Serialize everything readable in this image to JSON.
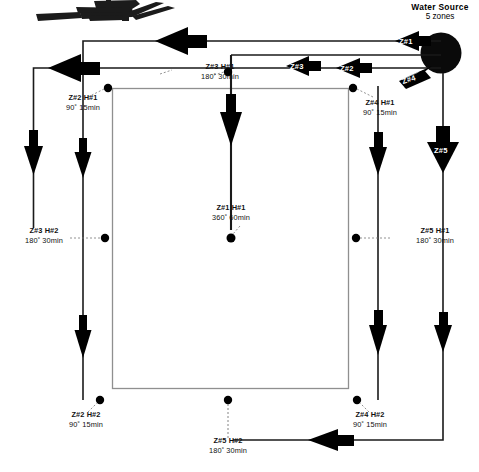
{
  "header": {
    "title_line1": "Water Source",
    "title_line2": "5 zones"
  },
  "zone_tags": [
    {
      "name": "zone-tag-1",
      "label": "Z#1"
    },
    {
      "name": "zone-tag-2",
      "label": "Z#2"
    },
    {
      "name": "zone-tag-3",
      "label": "Z#3"
    },
    {
      "name": "zone-tag-4",
      "label": "Z#4"
    },
    {
      "name": "zone-tag-5",
      "label": "Z#5"
    }
  ],
  "heads": [
    {
      "name": "head-z3-h1",
      "id": "Z#3  H#1",
      "spec": "180˚  30min"
    },
    {
      "name": "head-z2-h1",
      "id": "Z#2  H#1",
      "spec": "90˚  15min"
    },
    {
      "name": "head-z4-h1",
      "id": "Z#4  H#1",
      "spec": "90˚  15min"
    },
    {
      "name": "head-z1-h1",
      "id": "Z#1  H#1",
      "spec": "360˚  60min"
    },
    {
      "name": "head-z3-h2",
      "id": "Z#3  H#2",
      "spec": "180˚  30min"
    },
    {
      "name": "head-z5-h1",
      "id": "Z#5  H#1",
      "spec": "180˚  30min"
    },
    {
      "name": "head-z2-h2",
      "id": "Z#2  H#2",
      "spec": "90˚  15min"
    },
    {
      "name": "head-z4-h2",
      "id": "Z#4  H#2",
      "spec": "90˚  15min"
    },
    {
      "name": "head-z5-h2",
      "id": "Z#5  H#2",
      "spec": "180˚  30min"
    }
  ],
  "colors": {
    "ink": "#000000",
    "pipe": "#1a1a1a",
    "lawn_outline": "#8f8f8f",
    "background": "#ffffff"
  }
}
